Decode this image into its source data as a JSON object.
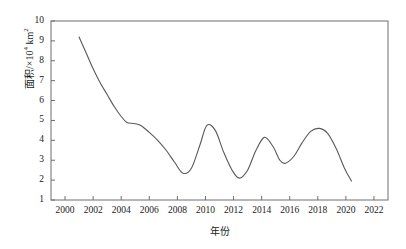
{
  "chart_data": {
    "type": "line",
    "title": "",
    "subtitle": "",
    "xlabel": "年份",
    "ylabel": "面积/×10⁴ km²",
    "xlim": [
      1999,
      2023
    ],
    "ylim": [
      1,
      10
    ],
    "grid": false,
    "legend": null,
    "x_tick_labels": [
      "2000",
      "2002",
      "2004",
      "2006",
      "2008",
      "2010",
      "2012",
      "2014",
      "2016",
      "2018",
      "2020",
      "2022"
    ],
    "x_ticks": [
      2000,
      2002,
      2004,
      2006,
      2008,
      2010,
      2012,
      2014,
      2016,
      2018,
      2020,
      2022
    ],
    "y_tick_labels": [
      "1",
      "2",
      "3",
      "4",
      "5",
      "6",
      "7",
      "8",
      "9",
      "10"
    ],
    "y_ticks": [
      1,
      2,
      3,
      4,
      5,
      6,
      7,
      8,
      9,
      10
    ],
    "series": [
      {
        "name": "面积",
        "color": "#595959",
        "x": [
          2001.0,
          2001.5,
          2002.0,
          2002.5,
          2003.0,
          2003.5,
          2004.0,
          2004.4,
          2004.9,
          2005.4,
          2006.0,
          2006.6,
          2007.2,
          2007.8,
          2008.4,
          2009.0,
          2009.6,
          2010.1,
          2010.7,
          2011.3,
          2011.9,
          2012.4,
          2013.0,
          2013.6,
          2014.2,
          2014.8,
          2015.3,
          2015.7,
          2016.3,
          2016.9,
          2017.5,
          2018.1,
          2018.7,
          2019.3,
          2019.9,
          2020.4
        ],
        "y": [
          9.2,
          8.4,
          7.6,
          6.9,
          6.3,
          5.7,
          5.2,
          4.9,
          4.85,
          4.75,
          4.4,
          4.0,
          3.5,
          2.9,
          2.35,
          2.6,
          3.75,
          4.75,
          4.5,
          3.4,
          2.5,
          2.1,
          2.5,
          3.5,
          4.15,
          3.7,
          3.0,
          2.85,
          3.2,
          3.9,
          4.45,
          4.6,
          4.35,
          3.6,
          2.6,
          1.95
        ]
      }
    ]
  },
  "axes": {
    "y_axis_label": "面积/×10",
    "y_axis_exponent": "4",
    "y_axis_unit": " km",
    "y_axis_unit_exponent": "2",
    "x_axis_label": "年份"
  },
  "colors": {
    "line": "#595959",
    "frame": "#6e6e6e",
    "text": "#1a1a1a",
    "background": "#ffffff"
  }
}
